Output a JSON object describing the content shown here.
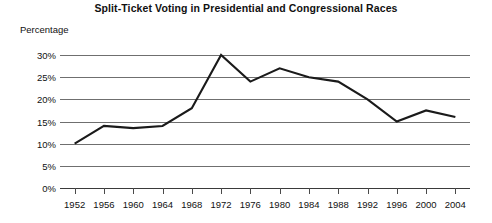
{
  "chart_data": {
    "type": "line",
    "title": "Split-Ticket Voting in Presidential and Congressional Races",
    "xlabel": "",
    "ylabel": "Percentage",
    "categories": [
      "1952",
      "1956",
      "1960",
      "1964",
      "1968",
      "1972",
      "1976",
      "1980",
      "1984",
      "1988",
      "1992",
      "1996",
      "2000",
      "2004"
    ],
    "values": [
      10,
      14,
      13.5,
      14,
      18,
      30,
      24,
      27,
      25,
      24,
      20,
      15,
      17.5,
      16
    ],
    "series": [
      {
        "name": "Split-ticket voting",
        "values": [
          10,
          14,
          13.5,
          14,
          18,
          30,
          24,
          27,
          25,
          24,
          20,
          15,
          17.5,
          16
        ]
      }
    ],
    "ylim": [
      0,
      30
    ],
    "ytick_values": [
      0,
      5,
      10,
      15,
      20,
      25,
      30
    ],
    "ytick_labels": [
      "0%",
      "5%",
      "10%",
      "15%",
      "20%",
      "25%",
      "30%"
    ],
    "grid": true,
    "legend": "none",
    "line_color": "#1a1a1a",
    "grid_color": "#6f6f6f",
    "background_color": "#ffffff"
  }
}
